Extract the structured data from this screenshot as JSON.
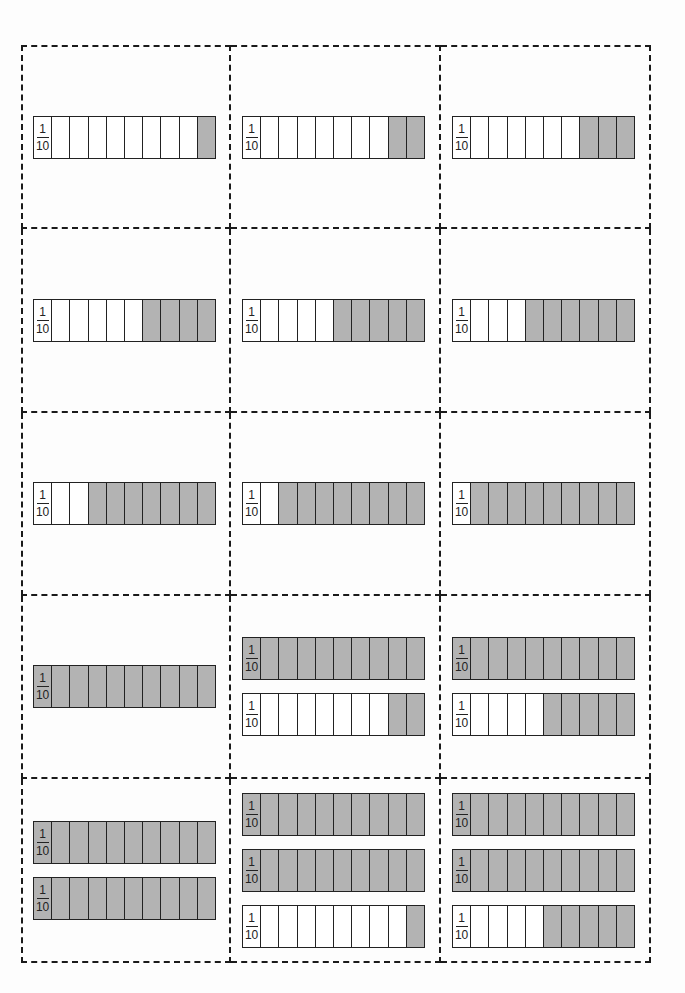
{
  "worksheet": {
    "fraction_label": {
      "numerator": "1",
      "denominator": "10"
    },
    "segments_per_bar": 10,
    "shade_color": "#b3b3b3",
    "cards": [
      {
        "bars": [
          1
        ]
      },
      {
        "bars": [
          2
        ]
      },
      {
        "bars": [
          3
        ]
      },
      {
        "bars": [
          4
        ]
      },
      {
        "bars": [
          5
        ]
      },
      {
        "bars": [
          6
        ]
      },
      {
        "bars": [
          7
        ]
      },
      {
        "bars": [
          8
        ]
      },
      {
        "bars": [
          9
        ]
      },
      {
        "bars": [
          10
        ]
      },
      {
        "bars": [
          10,
          2
        ]
      },
      {
        "bars": [
          10,
          5
        ]
      },
      {
        "bars": [
          10,
          10
        ]
      },
      {
        "bars": [
          10,
          10,
          1
        ]
      },
      {
        "bars": [
          10,
          10,
          5
        ]
      }
    ]
  }
}
